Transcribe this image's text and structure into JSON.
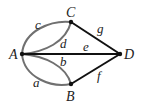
{
  "graph": {
    "vertices": [
      {
        "id": "A",
        "label": "A",
        "x": 22,
        "y": 54
      },
      {
        "id": "B",
        "label": "B",
        "x": 71,
        "y": 84
      },
      {
        "id": "C",
        "label": "C",
        "x": 71,
        "y": 22
      },
      {
        "id": "D",
        "label": "D",
        "x": 120,
        "y": 54
      }
    ],
    "edges": [
      {
        "id": "a",
        "label": "a",
        "from": "A",
        "to": "B",
        "color": "#707070"
      },
      {
        "id": "b",
        "label": "b",
        "from": "A",
        "to": "B",
        "color": "#707070"
      },
      {
        "id": "c",
        "label": "c",
        "from": "A",
        "to": "C",
        "color": "#707070"
      },
      {
        "id": "d",
        "label": "d",
        "from": "A",
        "to": "C",
        "color": "#707070"
      },
      {
        "id": "e",
        "label": "e",
        "from": "A",
        "to": "D",
        "color": "#111111"
      },
      {
        "id": "f",
        "label": "f",
        "from": "B",
        "to": "D",
        "color": "#111111"
      },
      {
        "id": "g",
        "label": "g",
        "from": "C",
        "to": "D",
        "color": "#111111"
      }
    ]
  }
}
